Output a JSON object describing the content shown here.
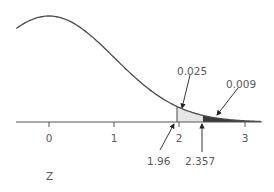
{
  "chart_data": {
    "type": "area",
    "title": "",
    "subtitle": "",
    "distribution": "standard normal density",
    "xlabel": "Z",
    "ylabel": "",
    "xlim": [
      -0.5,
      3.25
    ],
    "x_ticks": [
      0,
      1,
      2,
      3
    ],
    "x_tick_labels": [
      "0",
      "1",
      "2",
      "3"
    ],
    "grid": false,
    "legend": null,
    "shaded_regions": [
      {
        "name": "light",
        "from": 1.96,
        "to": 2.357,
        "area_label": "0.025",
        "color": "#e6e6e6"
      },
      {
        "name": "dark",
        "from": 2.357,
        "to": 3.25,
        "area_label": "0.009",
        "color": "#3a3a3a"
      }
    ],
    "annotations": [
      {
        "text": "0.025",
        "points_to": "light shaded region",
        "x": 2.05
      },
      {
        "text": "0.009",
        "points_to": "dark shaded region",
        "x": 2.55
      },
      {
        "text": "1.96",
        "points_to": "z = 1.96 on axis",
        "x": 1.96
      },
      {
        "text": "2.357",
        "points_to": "z = 2.357 on axis",
        "x": 2.357
      }
    ]
  },
  "labels": {
    "tick_0": "0",
    "tick_1": "1",
    "tick_2": "2",
    "tick_3": "3",
    "area_light": "0.025",
    "area_dark": "0.009",
    "z_left": "1.96",
    "z_right": "2.357",
    "axis": "Z"
  },
  "colors": {
    "curve": "#4a4a4a",
    "axis": "#555555",
    "light_fill": "#e6e6e6",
    "dark_fill": "#3a3a3a",
    "text": "#5a5a5a"
  }
}
